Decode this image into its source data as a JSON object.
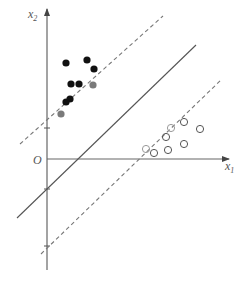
{
  "diagram": {
    "type": "svm-margin",
    "axes": {
      "origin_label": "O",
      "x_label": "x",
      "x_sub": "1",
      "y_label": "x",
      "y_sub": "2",
      "color": "#555555"
    },
    "lines": {
      "hyperplane": {
        "style": "solid",
        "x1": 17,
        "y1": 218,
        "x2": 196,
        "y2": 45
      },
      "upper_margin": {
        "style": "dashed",
        "x1": 20,
        "y1": 144,
        "x2": 163,
        "y2": 16
      },
      "lower_margin": {
        "style": "dashed",
        "x1": 41,
        "y1": 254,
        "x2": 221,
        "y2": 80
      }
    },
    "positive_points": [
      {
        "x": 66,
        "y": 63
      },
      {
        "x": 87,
        "y": 60
      },
      {
        "x": 94,
        "y": 69
      },
      {
        "x": 71,
        "y": 84
      },
      {
        "x": 79,
        "y": 84
      },
      {
        "x": 70,
        "y": 99
      },
      {
        "x": 66,
        "y": 102
      }
    ],
    "positive_support_vectors": [
      {
        "x": 93,
        "y": 85
      },
      {
        "x": 61,
        "y": 114
      }
    ],
    "negative_points": [
      {
        "x": 184,
        "y": 122
      },
      {
        "x": 200,
        "y": 129
      },
      {
        "x": 166,
        "y": 137
      },
      {
        "x": 184,
        "y": 144
      },
      {
        "x": 168,
        "y": 150
      },
      {
        "x": 154,
        "y": 153
      }
    ],
    "negative_support_vectors": [
      {
        "x": 171,
        "y": 128
      },
      {
        "x": 146,
        "y": 149
      }
    ],
    "colors": {
      "filled": "#111111",
      "support_filled": "#7a7a7a",
      "hollow_stroke": "#555555",
      "support_hollow_stroke": "#9a9a9a",
      "line": "#555555"
    }
  }
}
